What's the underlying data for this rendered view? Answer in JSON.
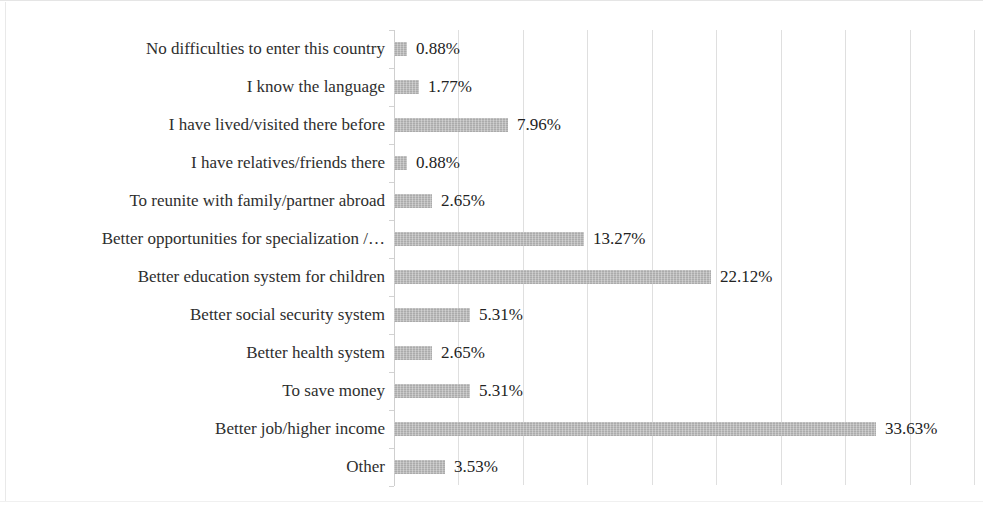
{
  "chart_data": {
    "type": "bar",
    "orientation": "horizontal",
    "title": "",
    "xlabel": "",
    "ylabel": "",
    "grid": true,
    "legend": false,
    "value_suffix": "%",
    "xlim": [
      0,
      40.5
    ],
    "gridline_step": 4.5,
    "categories": [
      "No difficulties to enter this country",
      "I know the language",
      "I have lived/visited there before",
      "I have relatives/friends there",
      "To reunite with family/partner abroad",
      "Better opportunities for specialization /…",
      "Better education system for children",
      "Better social security system",
      "Better health system",
      "To save money",
      "Better job/higher income",
      "Other"
    ],
    "values": [
      0.88,
      1.77,
      7.96,
      0.88,
      2.65,
      13.27,
      22.12,
      5.31,
      2.65,
      5.31,
      33.63,
      3.53
    ],
    "value_labels": [
      "0.88%",
      "1.77%",
      "7.96%",
      "0.88%",
      "2.65%",
      "13.27%",
      "22.12%",
      "5.31%",
      "2.65%",
      "5.31%",
      "33.63%",
      "3.53%"
    ],
    "bar_color": "#b4b4b4",
    "grid_color": "#d9d9d9",
    "text_color": "#2e2e2e"
  }
}
